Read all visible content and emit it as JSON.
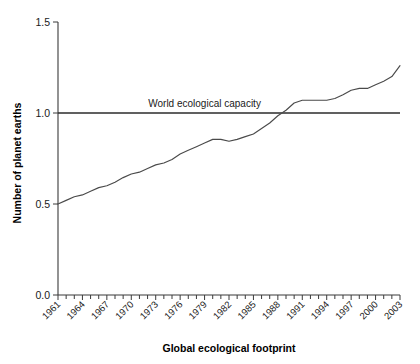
{
  "chart_data": {
    "type": "line",
    "title": "",
    "xlabel": "Global ecological footprint",
    "ylabel": "Number of planet earths",
    "xlim": [
      1961,
      2003
    ],
    "ylim": [
      0.0,
      1.5
    ],
    "grid": false,
    "legend": false,
    "y_ticks": [
      "0.0",
      "0.5",
      "1.0",
      "1.5"
    ],
    "y_tick_values": [
      0.0,
      0.5,
      1.0,
      1.5
    ],
    "x_tick_labels": [
      "1961",
      "1964",
      "1967",
      "1970",
      "1973",
      "1976",
      "1979",
      "1982",
      "1985",
      "1988",
      "1991",
      "1994",
      "1997",
      "2000",
      "2003"
    ],
    "x_minor_tick_interval": 1,
    "annotations": [
      {
        "name": "world-ecological-capacity",
        "text": "World ecological capacity",
        "y_value": 1.0,
        "x_value": 1979
      }
    ],
    "reference_lines": [
      {
        "name": "capacity-line",
        "y_value": 1.0,
        "label": "World ecological capacity"
      }
    ],
    "series": [
      {
        "name": "Global ecological footprint",
        "x": [
          1961,
          1962,
          1963,
          1964,
          1965,
          1966,
          1967,
          1968,
          1969,
          1970,
          1971,
          1972,
          1973,
          1974,
          1975,
          1976,
          1977,
          1978,
          1979,
          1980,
          1981,
          1982,
          1983,
          1984,
          1985,
          1986,
          1987,
          1988,
          1989,
          1990,
          1991,
          1992,
          1993,
          1994,
          1995,
          1996,
          1997,
          1998,
          1999,
          2000,
          2001,
          2002,
          2003
        ],
        "values": [
          0.5,
          0.52,
          0.54,
          0.55,
          0.57,
          0.59,
          0.6,
          0.62,
          0.645,
          0.665,
          0.675,
          0.695,
          0.715,
          0.725,
          0.745,
          0.775,
          0.795,
          0.815,
          0.835,
          0.855,
          0.855,
          0.845,
          0.855,
          0.87,
          0.885,
          0.915,
          0.945,
          0.985,
          1.015,
          1.055,
          1.07,
          1.07,
          1.07,
          1.07,
          1.08,
          1.1,
          1.125,
          1.135,
          1.135,
          1.155,
          1.175,
          1.2,
          1.26
        ]
      }
    ]
  },
  "colors": {
    "line": "#4a4a4a",
    "capacity": "#2b2b2b",
    "axis": "#3a3a3a",
    "text": "#1a1a1a",
    "background": "#ffffff"
  }
}
